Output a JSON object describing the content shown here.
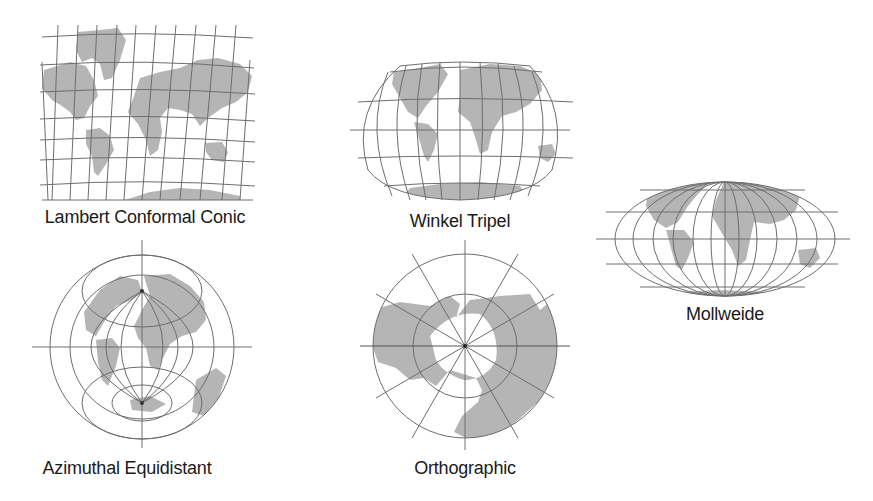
{
  "figure": {
    "colors": {
      "land": "#b5b5b5",
      "graticule": "#6e6e6e",
      "text": "#1a1a1a",
      "background": "#ffffff"
    },
    "projections": [
      {
        "id": "lambert",
        "label": "Lambert Conformal Conic"
      },
      {
        "id": "winkel",
        "label": "Winkel Tripel"
      },
      {
        "id": "mollweide",
        "label": "Mollweide"
      },
      {
        "id": "azimuthal",
        "label": "Azimuthal Equidistant"
      },
      {
        "id": "orthographic",
        "label": "Orthographic"
      }
    ]
  }
}
